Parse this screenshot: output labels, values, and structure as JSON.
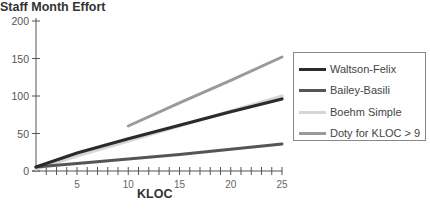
{
  "chart_data": {
    "type": "line",
    "title": "Staff Month Effort",
    "xlabel": "KLOC",
    "ylabel": "Staff Month Effort",
    "xlim": [
      1,
      25
    ],
    "ylim": [
      0,
      200
    ],
    "x_ticks": [
      5,
      10,
      15,
      20,
      25
    ],
    "y_ticks": [
      0,
      50,
      100,
      150,
      200
    ],
    "grid": false,
    "legend_position": "right",
    "series": [
      {
        "name": "Waltson-Felix",
        "color": "#2b2b2b",
        "x": [
          1,
          5,
          10,
          15,
          20,
          25
        ],
        "values": [
          5.2,
          24,
          43,
          61,
          79,
          96
        ]
      },
      {
        "name": "Bailey-Basili",
        "color": "#555555",
        "x": [
          1,
          5,
          10,
          15,
          20,
          25
        ],
        "values": [
          5.5,
          10,
          16,
          22,
          29,
          36
        ]
      },
      {
        "name": "Boehm Simple",
        "color": "#d6d6d6",
        "x": [
          1,
          5,
          10,
          15,
          20,
          25
        ],
        "values": [
          2.4,
          20,
          40,
          60,
          80,
          100
        ]
      },
      {
        "name": "Doty for KLOC > 9",
        "color": "#9a9a9a",
        "x": [
          10,
          15,
          20,
          25
        ],
        "values": [
          60,
          91,
          121,
          152
        ]
      }
    ]
  },
  "legend": {
    "items": [
      {
        "label": "Waltson-Felix",
        "color": "#2b2b2b"
      },
      {
        "label": "Bailey-Basili",
        "color": "#555555"
      },
      {
        "label": "Boehm Simple",
        "color": "#d6d6d6"
      },
      {
        "label": "Doty for KLOC > 9",
        "color": "#9a9a9a"
      }
    ]
  }
}
